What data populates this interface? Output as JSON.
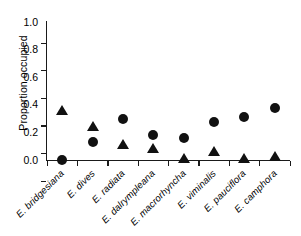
{
  "chart_data": {
    "type": "scatter",
    "title": "",
    "xlabel": "",
    "ylabel": "Proportion occupied",
    "ylim": [
      0.0,
      1.0
    ],
    "ytick_labels": [
      "0.0",
      "0.2",
      "0.4",
      "0.6",
      "0.8",
      "1.0"
    ],
    "ytick_values": [
      0.0,
      0.2,
      0.4,
      0.6,
      0.8,
      1.0
    ],
    "grid": false,
    "legend": "none",
    "categories": [
      "E. bridgesiana",
      "E. dives",
      "E. radiata",
      "E. dalrympleana",
      "E. macrorhyncha",
      "E. viminalis",
      "E. pauciflora",
      "E. camphora"
    ],
    "series": [
      {
        "name": "circle",
        "marker": "circle",
        "color": "#111111",
        "values": [
          0.0,
          0.13,
          0.3,
          0.18,
          0.16,
          0.275,
          0.31,
          0.375
        ]
      },
      {
        "name": "triangle",
        "marker": "triangle",
        "color": "#111111",
        "values": [
          0.36,
          0.245,
          0.11,
          0.08,
          0.01,
          0.065,
          0.01,
          0.025
        ]
      }
    ]
  }
}
